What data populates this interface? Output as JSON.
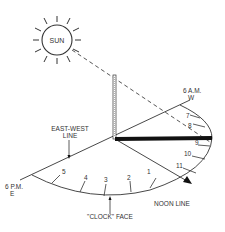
{
  "diagram": {
    "sun": {
      "label": "SUN"
    },
    "labels": {
      "six_am": "6 A.M.",
      "west": "W",
      "six_pm": "6 P.M.",
      "east": "E",
      "east_west_line_1": "EAST-WEST",
      "east_west_line_2": "LINE",
      "clock_face": "\"CLOCK\" FACE",
      "noon_line": "NOON LINE"
    },
    "hour_marks": {
      "morning": [
        "7",
        "8",
        "9",
        "10",
        "11"
      ],
      "afternoon": [
        "1",
        "2",
        "3",
        "4",
        "5"
      ]
    },
    "colors": {
      "line": "#333333",
      "shadow": "#111111"
    }
  }
}
